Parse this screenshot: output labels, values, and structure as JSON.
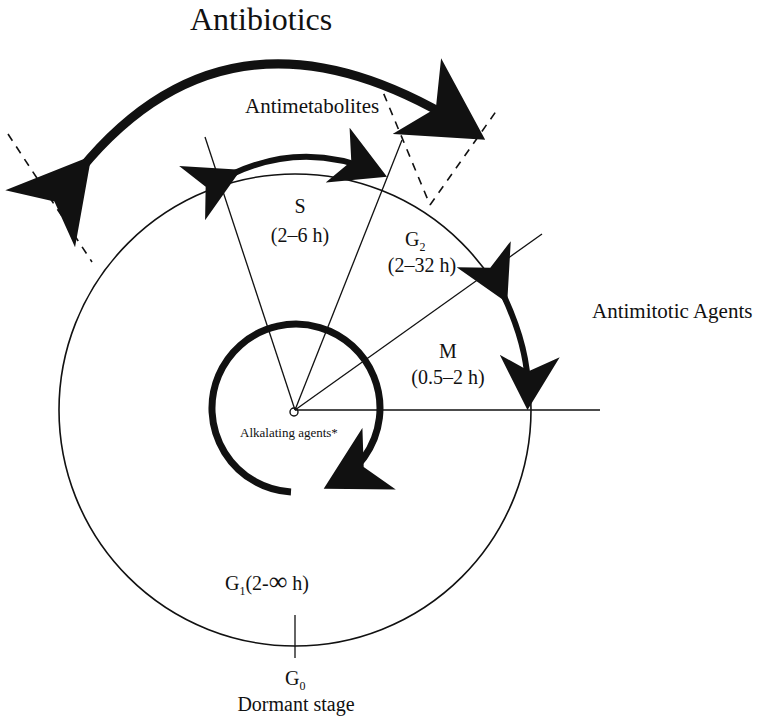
{
  "diagram": {
    "colors": {
      "background": "#ffffff",
      "ink": "#111111"
    },
    "drug_classes": {
      "antibiotics": "Antibiotics",
      "antimetabolites": "Antimetabolites",
      "antimitotic": "Antimitotic Agents",
      "alkylating": "Alkalating agents*"
    },
    "phases": {
      "s": {
        "name": "S",
        "duration": "(2–6 h)"
      },
      "g2": {
        "name": "G",
        "sub": "2",
        "duration": "(2–32 h)"
      },
      "m": {
        "name": "M",
        "duration": "(0.5–2 h)"
      },
      "g1": {
        "name": "G",
        "sub": "1",
        "duration_prefix": "(2-",
        "duration_symbol": "∞",
        "duration_suffix": " h)"
      },
      "g0": {
        "name": "G",
        "sub": "0",
        "description": "Dormant stage"
      }
    }
  }
}
